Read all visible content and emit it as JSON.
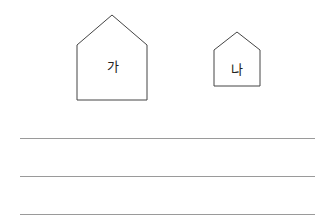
{
  "figures": [
    {
      "id": "house-a",
      "label": "가",
      "shape": "pentagon-house",
      "size": "large"
    },
    {
      "id": "house-b",
      "label": "나",
      "shape": "pentagon-house",
      "size": "small"
    }
  ],
  "answer_lines": 3,
  "colors": {
    "stroke": "#444444",
    "line": "#9a9a9a"
  }
}
